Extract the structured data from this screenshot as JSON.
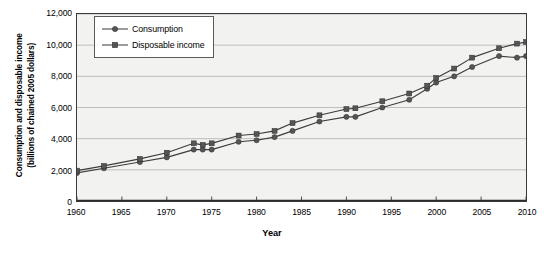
{
  "chart_data": {
    "type": "line",
    "title": "",
    "xlabel": "Year",
    "ylabel": "Consumption and disposable income (billions of chained 2005 dollars)",
    "ylabel_line1": "Consumption and disposable income",
    "ylabel_line2": "(billions of chained 2005 dollars)",
    "xlim": [
      1960,
      2010
    ],
    "ylim": [
      0,
      12000
    ],
    "xticks": [
      "1960",
      "1965",
      "1970",
      "1975",
      "1980",
      "1985",
      "1990",
      "1995",
      "2000",
      "2005",
      "2010"
    ],
    "xtick_values": [
      1960,
      1965,
      1970,
      1975,
      1980,
      1985,
      1990,
      1995,
      2000,
      2005,
      2010
    ],
    "yticks": [
      "0",
      "2,000",
      "4,000",
      "6,000",
      "8,000",
      "10,000",
      "12,000"
    ],
    "ytick_values": [
      0,
      2000,
      4000,
      6000,
      8000,
      10000,
      12000
    ],
    "grid": "horizontal",
    "legend_position": "top-left",
    "plot_background": "#f2f2f0",
    "line_color": "#3c3c3c",
    "marker_color": "#555555",
    "x": [
      1960,
      1963,
      1967,
      1970,
      1973,
      1974,
      1975,
      1978,
      1980,
      1982,
      1984,
      1987,
      1990,
      1991,
      1994,
      1997,
      1999,
      2000,
      2002,
      2004,
      2007,
      2009,
      2010
    ],
    "series": [
      {
        "name": "Consumption",
        "marker": "circle",
        "values": [
          1800,
          2100,
          2500,
          2800,
          3300,
          3300,
          3300,
          3800,
          3900,
          4100,
          4500,
          5100,
          5400,
          5400,
          6000,
          6500,
          7200,
          7600,
          8000,
          8600,
          9300,
          9200,
          9300
        ]
      },
      {
        "name": "Disposable income",
        "marker": "square",
        "values": [
          1950,
          2250,
          2700,
          3100,
          3700,
          3600,
          3700,
          4200,
          4300,
          4500,
          5000,
          5500,
          5900,
          5950,
          6400,
          6900,
          7400,
          7900,
          8500,
          9200,
          9800,
          10100,
          10200
        ]
      }
    ]
  },
  "legend": {
    "items": [
      {
        "label": "Consumption",
        "marker": "circle"
      },
      {
        "label": "Disposable income",
        "marker": "square"
      }
    ]
  }
}
